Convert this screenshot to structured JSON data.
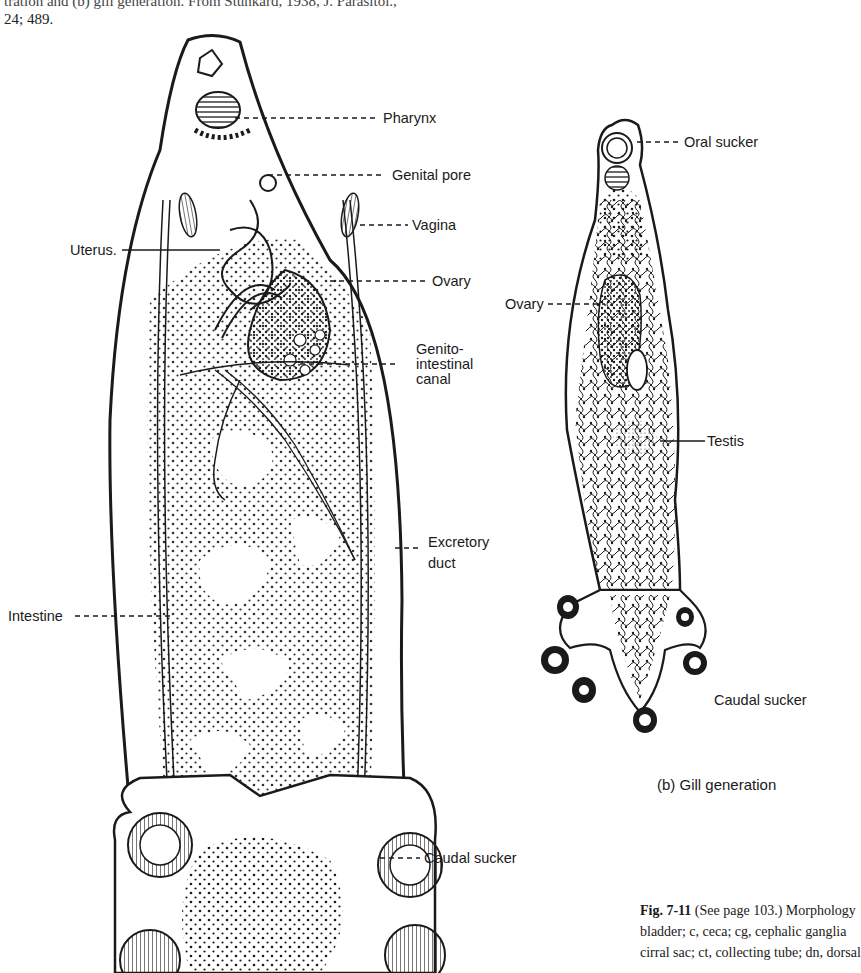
{
  "page": {
    "header_caption": {
      "line1": "tration and (b) gill generation. From Stunkard, 1938, J. Parasitol.,",
      "line2": "24; 489."
    }
  },
  "figure_a": {
    "labels": {
      "pharynx": "Pharynx",
      "genital_pore": "Genital pore",
      "vagina": "Vagina",
      "uterus": "Uterus.",
      "ovary": "Ovary",
      "genito_intestinal_1": "Genito-",
      "genito_intestinal_2": "intestinal",
      "genito_intestinal_3": "canal",
      "excretory_duct_1": "Excretory",
      "excretory_duct_2": "duct",
      "intestine": "Intestine",
      "caudal_sucker": "Caudal sucker"
    }
  },
  "figure_b": {
    "labels": {
      "oral_sucker": "Oral sucker",
      "ovary": "Ovary",
      "testis": "Testis",
      "caudal_sucker": "Caudal sucker"
    },
    "subcaption": "(b) Gill generation"
  },
  "figure_caption": {
    "line1_bold": "Fig. 7-11",
    "line1_rest": " (See page 103.) Morphology",
    "line2": "bladder; c, ceca; cg, cephalic ganglia",
    "line3": "cirral sac; ct, collecting tube; dn, dorsal"
  },
  "colors": {
    "ink": "#1a1a1a",
    "paper": "#ffffff"
  }
}
